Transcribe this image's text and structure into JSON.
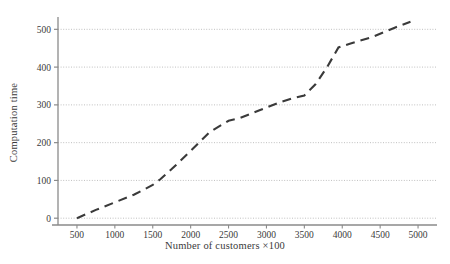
{
  "chart_data": {
    "type": "line",
    "title": "",
    "subtitle": "",
    "xlabel": "Number of customers ×100",
    "ylabel": "Computation time",
    "xlim": [
      250,
      5250
    ],
    "ylim": [
      -18,
      530
    ],
    "xticks": [
      500,
      1000,
      1500,
      2000,
      2500,
      3000,
      3500,
      4000,
      4500,
      5000
    ],
    "xtick_labels": [
      "500",
      "1000",
      "1500",
      "2000",
      "2500",
      "3000",
      "3500",
      "4000",
      "4500",
      "5000"
    ],
    "yticks": [
      0,
      100,
      200,
      300,
      400,
      500
    ],
    "ytick_labels": [
      "0",
      "100",
      "200",
      "300",
      "400",
      "500"
    ],
    "grid": true,
    "grid_axis": "y",
    "grid_style": "dotted",
    "legend": false,
    "legend_position": "none",
    "series": [
      {
        "name": "computation time",
        "line_style": "dashed",
        "color": "#3a3a3a",
        "marker": "none",
        "x": [
          500,
          750,
          1000,
          1250,
          1500,
          1600,
          1750,
          2000,
          2250,
          2500,
          2650,
          2900,
          3150,
          3350,
          3500,
          3650,
          3800,
          3950,
          4100,
          4400,
          4700,
          4900
        ],
        "y": [
          0,
          22,
          42,
          62,
          88,
          103,
          130,
          178,
          228,
          258,
          265,
          285,
          305,
          318,
          325,
          355,
          400,
          452,
          462,
          480,
          505,
          520
        ]
      }
    ],
    "annotations": []
  },
  "axis_labels": {
    "x": "Number of customers ×100",
    "y": "Computation time"
  },
  "colors": {
    "line": "#3a3a3a",
    "grid": "#b9b9b9",
    "axis": "#8a8a8a",
    "text": "#3a3a3a",
    "background": "#ffffff"
  }
}
